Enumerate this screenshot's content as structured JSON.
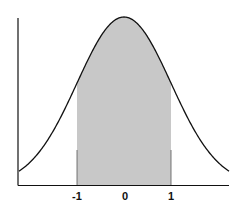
{
  "chart_data": {
    "type": "area",
    "title": "",
    "xlabel": "",
    "ylabel": "",
    "x_ticks": [
      "-1",
      "0",
      "1"
    ],
    "xlim": [
      -2.25,
      2.25
    ],
    "shaded_region": {
      "from": -1,
      "to": 1,
      "color": "#c8c8c8"
    },
    "curve": {
      "mean": 0,
      "sd": 1,
      "color": "#111111"
    },
    "grid": false,
    "legend": null
  },
  "labels": {
    "tick_neg1": "-1",
    "tick_0": "0",
    "tick_1": "1"
  }
}
